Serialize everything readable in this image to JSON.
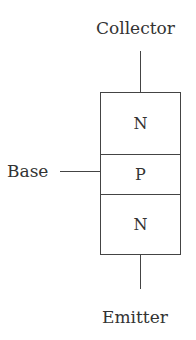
{
  "diagram": {
    "terminals": {
      "collector": "Collector",
      "base": "Base",
      "emitter": "Emitter"
    },
    "layers": [
      {
        "label": "N",
        "role": "collector-region"
      },
      {
        "label": "P",
        "role": "base-region"
      },
      {
        "label": "N",
        "role": "emitter-region"
      }
    ],
    "colors": {
      "line": "#444444",
      "text": "#333333",
      "background": "#ffffff"
    }
  }
}
